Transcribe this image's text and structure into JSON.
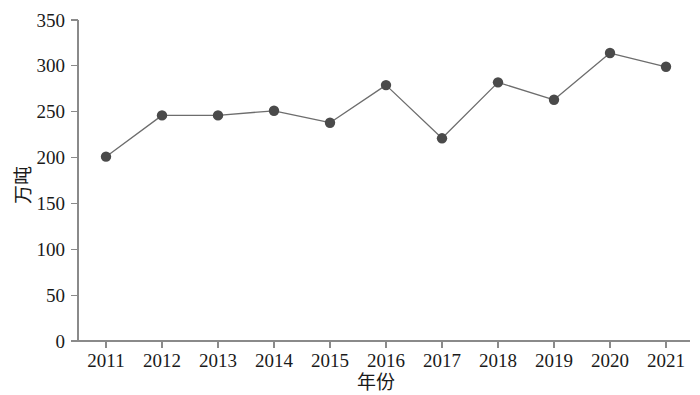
{
  "chart_data": {
    "type": "line",
    "title": "",
    "xlabel": "年份",
    "ylabel": "万吨",
    "x": [
      2011,
      2012,
      2013,
      2014,
      2015,
      2016,
      2017,
      2018,
      2019,
      2020,
      2021
    ],
    "categories": [
      "2011",
      "2012",
      "2013",
      "2014",
      "2015",
      "2016",
      "2017",
      "2018",
      "2019",
      "2020",
      "2021"
    ],
    "values": [
      201,
      246,
      246,
      251,
      238,
      279,
      221,
      282,
      263,
      314,
      299
    ],
    "series": [
      {
        "name": "",
        "values": [
          201,
          246,
          246,
          251,
          238,
          279,
          221,
          282,
          263,
          314,
          299
        ]
      }
    ],
    "ylim": [
      0,
      350
    ],
    "yticks": [
      0,
      50,
      100,
      150,
      200,
      250,
      300,
      350
    ],
    "ytick_labels": [
      "0",
      "50",
      "100",
      "150",
      "200",
      "250",
      "300",
      "350"
    ],
    "xlim": [
      2010.5,
      2021.6
    ],
    "grid": false,
    "legend": false,
    "legend_position": "none",
    "marker": "circle",
    "line_color": "#6d6d6d",
    "marker_color": "#4a4a4a",
    "axis_color": "#8a8a8a",
    "background_color": "#ffffff"
  }
}
